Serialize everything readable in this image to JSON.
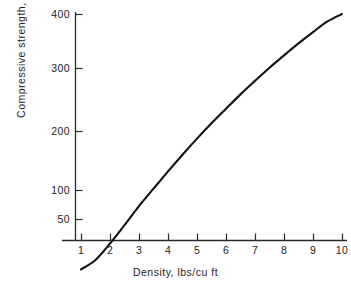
{
  "chart_data": {
    "type": "line",
    "title": "",
    "xlabel": "Density, lbs/cu ft",
    "ylabel": "Compressive strength, psi",
    "xscale": "linear",
    "yscale": "log",
    "xlim": [
      0.75,
      10.4
    ],
    "ylim": [
      28,
      400
    ],
    "grid": false,
    "legend": null,
    "xticks": [
      1,
      2,
      3,
      4,
      5,
      6,
      7,
      8,
      9,
      10
    ],
    "xtick_labels": [
      "1",
      "2",
      "3",
      "4",
      "5",
      "6",
      "7",
      "8",
      "9",
      "10"
    ],
    "yticks": [
      50,
      100,
      200,
      300,
      400
    ],
    "ytick_labels": [
      "50",
      "100",
      "200",
      "300",
      "400"
    ],
    "series": [
      {
        "name": "Compressive strength",
        "x": [
          1.0,
          1.5,
          2.0,
          2.5,
          3.0,
          3.5,
          4.0,
          4.5,
          5.0,
          5.5,
          6.0,
          6.5,
          7.0,
          7.5,
          8.0,
          8.5,
          9.0,
          9.5,
          10.0
        ],
        "values": [
          30,
          33,
          39,
          47,
          57,
          68,
          81,
          96,
          113,
          132,
          153,
          177,
          203,
          232,
          263,
          297,
          333,
          371,
          400
        ]
      }
    ]
  },
  "axes": {
    "x_title": "Density, lbs/cu ft",
    "y_title": "Compressive strength, psi",
    "x_ticks": [
      {
        "label": "1",
        "px": 81
      },
      {
        "label": "2",
        "px": 110
      },
      {
        "label": "3",
        "px": 139
      },
      {
        "label": "4",
        "px": 168
      },
      {
        "label": "5",
        "px": 197
      },
      {
        "label": "6",
        "px": 226
      },
      {
        "label": "7",
        "px": 255
      },
      {
        "label": "8",
        "px": 284
      },
      {
        "label": "9",
        "px": 313
      },
      {
        "label": "10",
        "px": 342
      }
    ],
    "y_ticks": [
      {
        "label": "400",
        "py": 14
      },
      {
        "label": "300",
        "py": 68
      },
      {
        "label": "200",
        "py": 131
      },
      {
        "label": "100",
        "py": 190
      },
      {
        "label": "50",
        "py": 219
      }
    ]
  },
  "style": {
    "curve_color": "#111111",
    "axis_color": "#2a2a2a",
    "text_color": "#1c1c1c",
    "background": "#ffffff"
  }
}
